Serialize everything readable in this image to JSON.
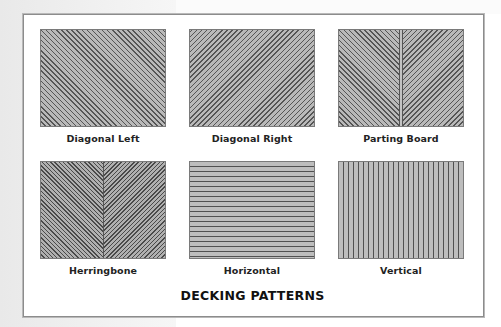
{
  "figure": {
    "title": "DECKING PATTERNS",
    "colors": {
      "panel_border": "#8c8c8c",
      "tile_fill": "#b9b9b9",
      "stripe_line": "#555555",
      "label_text": "#222222"
    },
    "patterns": [
      {
        "label": "Diagonal Left",
        "style": "diagonal-left"
      },
      {
        "label": "Diagonal Right",
        "style": "diagonal-right"
      },
      {
        "label": "Parting Board",
        "style": "parting-board"
      },
      {
        "label": "Herringbone",
        "style": "herringbone"
      },
      {
        "label": "Horizontal",
        "style": "horizontal"
      },
      {
        "label": "Vertical",
        "style": "vertical"
      }
    ]
  }
}
